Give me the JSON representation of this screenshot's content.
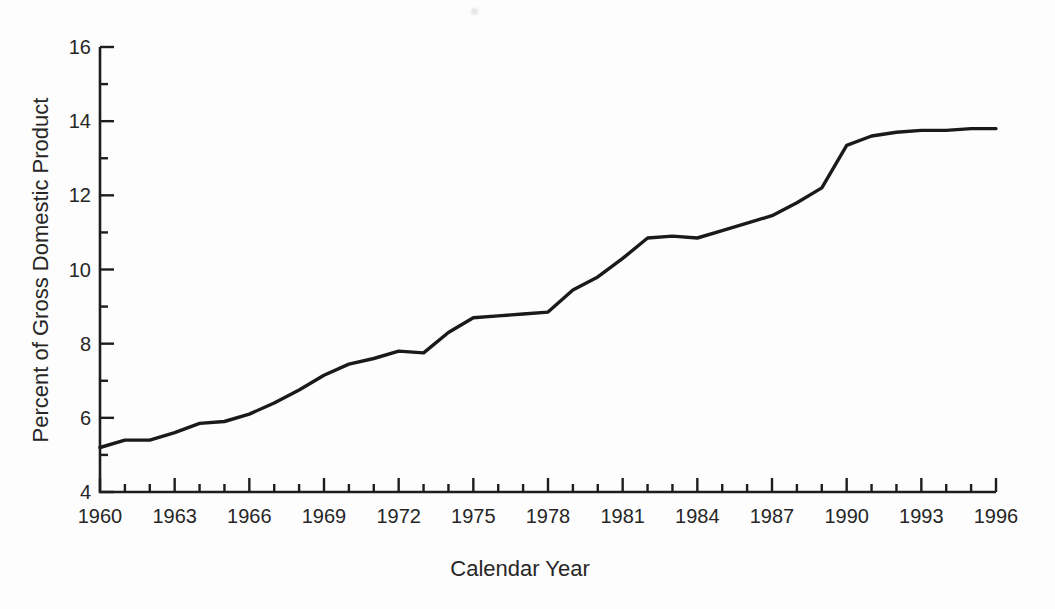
{
  "figure": {
    "background": "#fdfdfd",
    "axis_color": "#1d1d1d",
    "line_color": "#1a1a1a",
    "text_color": "#262626"
  },
  "chart_data": {
    "type": "line",
    "title": "",
    "xlabel": "Calendar Year",
    "ylabel": "Percent of Gross Domestic Product",
    "xlim": [
      1960,
      1996
    ],
    "ylim": [
      4,
      16
    ],
    "x_major_ticks": [
      1960,
      1963,
      1966,
      1969,
      1972,
      1975,
      1978,
      1981,
      1984,
      1987,
      1990,
      1993,
      1996
    ],
    "x_minor_step": 1,
    "y_major_ticks": [
      4,
      6,
      8,
      10,
      12,
      14,
      16
    ],
    "y_minor_step": 1,
    "grid": "off",
    "legend": "none",
    "x": [
      1960,
      1961,
      1962,
      1963,
      1964,
      1965,
      1966,
      1967,
      1968,
      1969,
      1970,
      1971,
      1972,
      1973,
      1974,
      1975,
      1976,
      1977,
      1978,
      1979,
      1980,
      1981,
      1982,
      1983,
      1984,
      1985,
      1986,
      1987,
      1988,
      1989,
      1990,
      1991,
      1992,
      1993,
      1994,
      1995,
      1996
    ],
    "y": [
      5.2,
      5.4,
      5.4,
      5.6,
      5.85,
      5.9,
      6.1,
      6.4,
      6.75,
      7.15,
      7.45,
      7.6,
      7.8,
      7.75,
      8.3,
      8.7,
      8.75,
      8.8,
      8.85,
      9.45,
      9.8,
      10.3,
      10.85,
      10.9,
      10.85,
      11.05,
      11.25,
      11.45,
      11.8,
      12.2,
      13.35,
      13.6,
      13.7,
      13.75,
      13.75,
      13.8,
      13.8
    ]
  }
}
